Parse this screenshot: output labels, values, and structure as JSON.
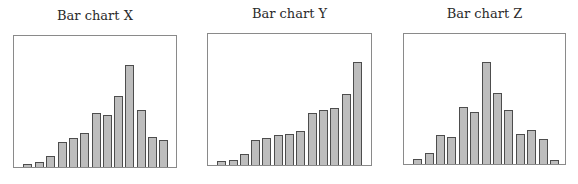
{
  "chart_data": [
    {
      "type": "bar",
      "title": "Bar chart X",
      "xlabel": "",
      "ylabel": "",
      "ylim": [
        0,
        133
      ],
      "grid": false,
      "legend": null,
      "categories": [
        "1",
        "2",
        "3",
        "4",
        "5",
        "6",
        "7",
        "8",
        "9",
        "10",
        "11",
        "12",
        "13"
      ],
      "values": [
        3,
        5,
        11,
        25,
        29,
        34,
        54,
        52,
        72,
        103,
        57,
        30,
        27
      ],
      "frame": {
        "left": 13,
        "top": 35,
        "width": 164,
        "height": 133
      },
      "bar_x": [
        23,
        35,
        46,
        58,
        69,
        80,
        92,
        103,
        114,
        125,
        137,
        148,
        159
      ],
      "bar_width": 9
    },
    {
      "type": "bar",
      "title": "Bar chart Y",
      "xlabel": "",
      "ylabel": "",
      "ylim": [
        0,
        133
      ],
      "grid": false,
      "legend": null,
      "categories": [
        "1",
        "2",
        "3",
        "4",
        "5",
        "6",
        "7",
        "8",
        "9",
        "10",
        "11",
        "12",
        "13"
      ],
      "values": [
        4,
        5,
        11,
        25,
        27,
        30,
        31,
        34,
        52,
        55,
        57,
        72,
        104
      ],
      "frame": {
        "left": 207,
        "top": 33,
        "width": 165,
        "height": 133
      },
      "bar_x": [
        217,
        229,
        240,
        251,
        262,
        274,
        285,
        296,
        308,
        319,
        330,
        342,
        353
      ],
      "bar_width": 9
    },
    {
      "type": "bar",
      "title": "Bar chart Z",
      "xlabel": "",
      "ylabel": "",
      "ylim": [
        0,
        132
      ],
      "grid": false,
      "legend": null,
      "categories": [
        "1",
        "2",
        "3",
        "4",
        "5",
        "6",
        "7",
        "8",
        "9",
        "10",
        "11",
        "12",
        "13"
      ],
      "values": [
        5,
        11,
        29,
        27,
        57,
        52,
        103,
        72,
        54,
        30,
        34,
        25,
        4
      ],
      "frame": {
        "left": 403,
        "top": 33,
        "width": 163,
        "height": 132
      },
      "bar_x": [
        413,
        425,
        436,
        447,
        459,
        470,
        482,
        493,
        504,
        516,
        527,
        539,
        550
      ],
      "bar_width": 9
    }
  ],
  "colors": {
    "bar_fill": "#bdbdbd",
    "bar_stroke": "#4d4d4d",
    "frame": "#8a8a8a",
    "title": "#2a2a2a"
  }
}
